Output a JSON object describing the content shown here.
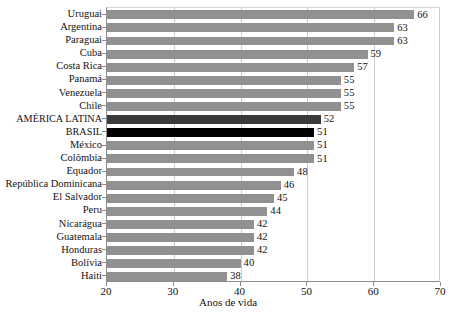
{
  "chart_data": {
    "type": "bar",
    "orientation": "horizontal",
    "title": "",
    "xlabel": "Anos de vida",
    "ylabel": "",
    "xlim": [
      20,
      70
    ],
    "xticks": [
      20,
      30,
      40,
      50,
      60,
      70
    ],
    "grid": true,
    "grid_axis": "x",
    "legend": null,
    "categories": [
      "Uruguai",
      "Argentina",
      "Paraguai",
      "Cuba",
      "Costa Rica",
      "Panamá",
      "Venezuela",
      "Chile",
      "AMÉRICA LATINA",
      "BRASIL",
      "México",
      "Colômbia",
      "Equador",
      "República Dominicana",
      "El Salvador",
      "Peru",
      "Nicarágua",
      "Guatemala",
      "Honduras",
      "Bolívia",
      "Haiti"
    ],
    "values": [
      66,
      63,
      63,
      59,
      57,
      55,
      55,
      55,
      52,
      51,
      51,
      51,
      48,
      46,
      45,
      44,
      42,
      42,
      42,
      40,
      38
    ],
    "value_labels": [
      "66",
      "63",
      "63",
      "59",
      "57",
      "55",
      "55",
      "55",
      "52",
      "51",
      "51",
      "51",
      "48",
      "46",
      "45",
      "44",
      "42",
      "42",
      "42",
      "40",
      "38"
    ],
    "highlighted": {
      "AMÉRICA LATINA": "#3b3b3b",
      "BRASIL": "#000000"
    },
    "colors": {
      "bar_default": "#919191",
      "bar_america_latina": "#3b3b3b",
      "bar_brasil": "#000000",
      "gridline": "#cccccc",
      "axis": "#8c8c8c",
      "text": "#111111"
    }
  },
  "axis": {
    "x_title": "Anos de vida",
    "tick_labels": [
      "20",
      "30",
      "40",
      "50",
      "60",
      "70"
    ]
  }
}
